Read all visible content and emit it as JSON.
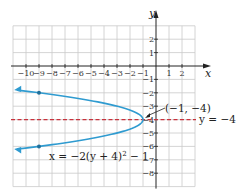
{
  "chart_data": {
    "type": "line",
    "title": "",
    "xlabel": "x",
    "ylabel": "y",
    "xlim": [
      -11,
      3
    ],
    "ylim": [
      -9,
      3
    ],
    "grid": true,
    "x_ticks": [
      -10,
      -9,
      -8,
      -7,
      -6,
      -5,
      -4,
      -3,
      -2,
      -1,
      1,
      2
    ],
    "x_tick_labels": [
      "−10",
      "−9",
      "−8",
      "−7",
      "−6",
      "−5",
      "−4",
      "−3",
      "−2",
      "−1",
      "1",
      "2"
    ],
    "y_ticks": [
      2,
      1,
      -1,
      -2,
      -3,
      -4,
      -5,
      -6,
      -7,
      -8
    ],
    "y_tick_labels": [
      "2",
      "1",
      "−1",
      "−2",
      "−3",
      "−4",
      "−5",
      "−6",
      "−7",
      "−8"
    ],
    "series": [
      {
        "name": "x = −2(y + 4)² − 1",
        "kind": "parabola",
        "equation": "x = -2(y+4)^2 - 1",
        "color": "#2f9bd0",
        "vertex": [
          -1,
          -4
        ],
        "points": [
          [
            -9,
            -2
          ],
          [
            -1,
            -4
          ],
          [
            -9,
            -6
          ]
        ],
        "marked_points": [
          [
            -9,
            -2
          ],
          [
            -9,
            -6
          ]
        ],
        "arrows_at_ends": true
      },
      {
        "name": "y = −4",
        "kind": "axis_of_symmetry",
        "style": "dashed",
        "color": "#c8323c",
        "y": -4
      }
    ],
    "annotations": [
      {
        "text": "(−1, −4)",
        "points_to": [
          -1,
          -4
        ]
      },
      {
        "text": "y = −4",
        "attached_to": "axis_of_symmetry"
      },
      {
        "text": "x = −2(y + 4)² − 1",
        "attached_to": "parabola"
      }
    ]
  },
  "labels": {
    "x_axis": "x",
    "y_axis": "y",
    "vertex_label": "(−1, −4)",
    "symmetry_label": "y = −4",
    "equation_label_prefix": "x = −2(y + 4)",
    "equation_label_exp": "2",
    "equation_label_suffix": " − 1"
  }
}
